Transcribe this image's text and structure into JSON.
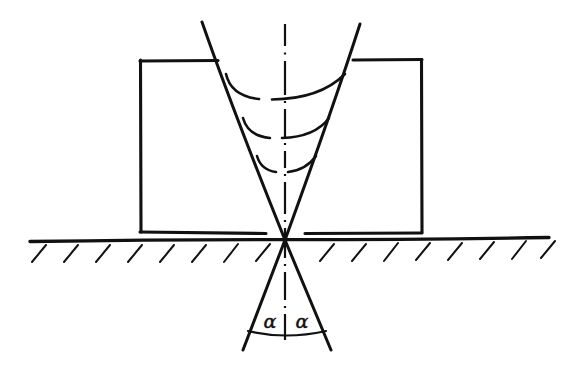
{
  "figure": {
    "kind": "engineering-line-drawing",
    "title": "",
    "background_color": "#ffffff",
    "ink_color": "#111111",
    "canvas": {
      "width": 571,
      "height": 384
    },
    "labels": {
      "angle_left": "α",
      "angle_right": "α"
    },
    "parts": {
      "workpiece_label": "workpiece-rectangle",
      "ground_label": "ground-line",
      "hatching_label": "ground-hatching",
      "cone_upper_label": "upper-cone",
      "cone_lower_label": "lower-cone",
      "centerline_label": "vertical-centerline",
      "arcs_label": "beam-wavefront-arcs",
      "angle_arc_label": "angle-arc"
    },
    "geometry": {
      "rectangle": {
        "left": 140,
        "top": 60,
        "right": 422,
        "bottom": 232
      },
      "ground_line": {
        "x1": 30,
        "y1": 241,
        "x2": 549,
        "y2": 238
      },
      "apex": {
        "x": 285,
        "y": 240
      },
      "upper_cone": {
        "left_top": {
          "x": 202,
          "y": 22
        },
        "right_top": {
          "x": 360,
          "y": 24
        }
      },
      "lower_cone": {
        "left_bottom": {
          "x": 243,
          "y": 350
        },
        "right_bottom": {
          "x": 331,
          "y": 350
        }
      },
      "arcs": [
        {
          "x1": 226,
          "y1": 74,
          "x2": 345,
          "y2": 74,
          "sag": 24
        },
        {
          "x1": 243,
          "y1": 118,
          "x2": 329,
          "y2": 118,
          "sag": 20
        },
        {
          "x1": 257,
          "y1": 156,
          "x2": 316,
          "y2": 156,
          "sag": 15
        }
      ],
      "angle_arc": {
        "x1": 249,
        "y1": 332,
        "x2": 325,
        "y2": 332,
        "sag": 6
      },
      "alpha_positions": [
        {
          "x": 269,
          "y": 328
        },
        {
          "x": 303,
          "y": 328
        }
      ],
      "hatch_strokes": {
        "count_left": 13,
        "count_right": 13,
        "length": 18,
        "angle_deg": 60
      }
    }
  }
}
